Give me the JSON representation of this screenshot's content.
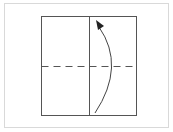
{
  "diagram": {
    "type": "origami-fold-step",
    "frame": {
      "border_color": "#d9d9d9",
      "background": "#ffffff"
    },
    "paper_square": {
      "x": 41,
      "y": 16,
      "width": 95,
      "height": 99,
      "stroke": "#555555"
    },
    "crease_line": {
      "kind": "solid",
      "orientation": "vertical",
      "x": 89
    },
    "valley_fold_line": {
      "kind": "dashed",
      "orientation": "horizontal",
      "y": 66,
      "stroke": "#555555"
    },
    "fold_arrow": {
      "direction": "up",
      "from": [
        95,
        113
      ],
      "to": [
        97,
        22
      ],
      "stroke": "#444444"
    }
  }
}
